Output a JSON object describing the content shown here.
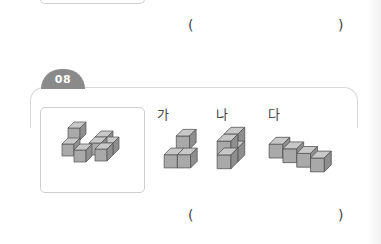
{
  "previous_question": {
    "answer_paren_open": "(",
    "answer_paren_close": ")"
  },
  "question": {
    "number": "08",
    "given_figure": "given-cube-shape (7 cubes)",
    "options": [
      {
        "label": "가",
        "shape": "4-cube shape"
      },
      {
        "label": "나",
        "shape": "4-cube 2x2 vertical"
      },
      {
        "label": "다",
        "shape": "4-cube row"
      }
    ],
    "answer_paren_open": "(",
    "answer_paren_close": ")"
  },
  "colors": {
    "cube_front": "#a9a9a9",
    "cube_top": "#c8c8c8",
    "cube_side": "#8e8e8e",
    "badge": "#8a8a8a",
    "frame": "#d6d6d6"
  }
}
